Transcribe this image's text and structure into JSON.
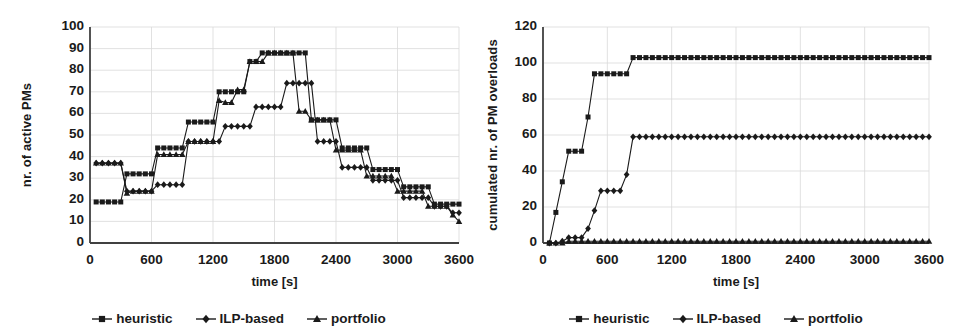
{
  "figure": {
    "background": "#ffffff",
    "ink": "#1a1a1a",
    "gridline_color": "#d9d9d9",
    "axis_color": "#404040"
  },
  "charts": [
    {
      "id": "left",
      "chart_data": {
        "type": "line",
        "title": "",
        "subtitle": "",
        "xlabel": "time [s]",
        "ylabel": "nr. of active PMs",
        "xlim": [
          0,
          3600
        ],
        "ylim": [
          0,
          100
        ],
        "xticks": [
          0,
          600,
          1200,
          1800,
          2400,
          3000,
          3600
        ],
        "yticks": [
          0,
          10,
          20,
          30,
          40,
          50,
          60,
          70,
          80,
          90,
          100
        ],
        "grid": true,
        "legend_position": "bottom",
        "series": [
          {
            "name": "heuristic",
            "marker": "square",
            "x": [
              60,
              120,
              180,
              240,
              300,
              360,
              420,
              480,
              540,
              600,
              660,
              720,
              780,
              840,
              900,
              960,
              1020,
              1080,
              1140,
              1200,
              1260,
              1320,
              1380,
              1440,
              1500,
              1560,
              1620,
              1680,
              1740,
              1800,
              1860,
              1920,
              1980,
              2040,
              2100,
              2160,
              2220,
              2280,
              2340,
              2400,
              2460,
              2520,
              2580,
              2640,
              2700,
              2760,
              2820,
              2880,
              2940,
              3000,
              3060,
              3120,
              3180,
              3240,
              3300,
              3360,
              3420,
              3480,
              3540,
              3600
            ],
            "y": [
              19,
              19,
              19,
              19,
              19,
              32,
              32,
              32,
              32,
              32,
              44,
              44,
              44,
              44,
              44,
              56,
              56,
              56,
              56,
              56,
              70,
              70,
              70,
              70,
              70,
              84,
              84,
              88,
              88,
              88,
              88,
              88,
              88,
              88,
              88,
              57,
              57,
              57,
              57,
              57,
              44,
              44,
              44,
              44,
              44,
              34,
              34,
              34,
              34,
              34,
              26,
              26,
              26,
              26,
              26,
              18,
              18,
              18,
              18,
              18
            ]
          },
          {
            "name": "ILP-based",
            "marker": "diamond",
            "x": [
              60,
              120,
              180,
              240,
              300,
              360,
              420,
              480,
              540,
              600,
              660,
              720,
              780,
              840,
              900,
              960,
              1020,
              1080,
              1140,
              1200,
              1260,
              1320,
              1380,
              1440,
              1500,
              1560,
              1620,
              1680,
              1740,
              1800,
              1860,
              1920,
              1980,
              2040,
              2100,
              2160,
              2220,
              2280,
              2340,
              2400,
              2460,
              2520,
              2580,
              2640,
              2700,
              2760,
              2820,
              2880,
              2940,
              3000,
              3060,
              3120,
              3180,
              3240,
              3300,
              3360,
              3420,
              3480,
              3540,
              3600
            ],
            "y": [
              37,
              37,
              37,
              37,
              37,
              24,
              24,
              24,
              24,
              24,
              27,
              27,
              27,
              27,
              27,
              47,
              47,
              47,
              47,
              47,
              47,
              54,
              54,
              54,
              54,
              54,
              63,
              63,
              63,
              63,
              63,
              74,
              74,
              74,
              74,
              74,
              47,
              47,
              47,
              47,
              35,
              35,
              35,
              35,
              35,
              29,
              29,
              29,
              29,
              29,
              21,
              21,
              21,
              21,
              21,
              17,
              17,
              17,
              14,
              14
            ]
          },
          {
            "name": "portfolio",
            "marker": "triangle",
            "x": [
              60,
              120,
              180,
              240,
              300,
              360,
              420,
              480,
              540,
              600,
              660,
              720,
              780,
              840,
              900,
              960,
              1020,
              1080,
              1140,
              1200,
              1260,
              1320,
              1380,
              1440,
              1500,
              1560,
              1620,
              1680,
              1740,
              1800,
              1860,
              1920,
              1980,
              2040,
              2100,
              2160,
              2220,
              2280,
              2340,
              2400,
              2460,
              2520,
              2580,
              2640,
              2700,
              2760,
              2820,
              2880,
              2940,
              3000,
              3060,
              3120,
              3180,
              3240,
              3300,
              3360,
              3420,
              3480,
              3540,
              3600
            ],
            "y": [
              37,
              37,
              37,
              37,
              37,
              23,
              24,
              24,
              24,
              24,
              41,
              41,
              41,
              41,
              41,
              47,
              47,
              47,
              47,
              47,
              66,
              65,
              65,
              71,
              71,
              84,
              84,
              84,
              88,
              88,
              88,
              88,
              88,
              61,
              61,
              57,
              57,
              57,
              57,
              43,
              43,
              43,
              43,
              43,
              31,
              31,
              31,
              31,
              31,
              24,
              24,
              24,
              24,
              24,
              17,
              17,
              17,
              17,
              13,
              10
            ]
          }
        ]
      }
    },
    {
      "id": "right",
      "chart_data": {
        "type": "line",
        "title": "",
        "subtitle": "",
        "xlabel": "time [s]",
        "ylabel": "cumulated nr. of PM overloads",
        "xlim": [
          0,
          3600
        ],
        "ylim": [
          0,
          120
        ],
        "xticks": [
          0,
          600,
          1200,
          1800,
          2400,
          3000,
          3600
        ],
        "yticks": [
          0,
          20,
          40,
          60,
          80,
          100,
          120
        ],
        "grid": true,
        "legend_position": "bottom",
        "series": [
          {
            "name": "heuristic",
            "marker": "square",
            "x": [
              60,
              120,
              180,
              240,
              300,
              360,
              420,
              480,
              540,
              600,
              660,
              720,
              780,
              840,
              900,
              960,
              1020,
              1080,
              1140,
              1200,
              1260,
              1320,
              1380,
              1440,
              1500,
              1560,
              1620,
              1680,
              1740,
              1800,
              1860,
              1920,
              1980,
              2040,
              2100,
              2160,
              2220,
              2280,
              2340,
              2400,
              2460,
              2520,
              2580,
              2640,
              2700,
              2760,
              2820,
              2880,
              2940,
              3000,
              3060,
              3120,
              3180,
              3240,
              3300,
              3360,
              3420,
              3480,
              3540,
              3600
            ],
            "y": [
              0,
              17,
              34,
              51,
              51,
              51,
              70,
              94,
              94,
              94,
              94,
              94,
              94,
              103,
              103,
              103,
              103,
              103,
              103,
              103,
              103,
              103,
              103,
              103,
              103,
              103,
              103,
              103,
              103,
              103,
              103,
              103,
              103,
              103,
              103,
              103,
              103,
              103,
              103,
              103,
              103,
              103,
              103,
              103,
              103,
              103,
              103,
              103,
              103,
              103,
              103,
              103,
              103,
              103,
              103,
              103,
              103,
              103,
              103,
              103
            ]
          },
          {
            "name": "ILP-based",
            "marker": "diamond",
            "x": [
              60,
              120,
              180,
              240,
              300,
              360,
              420,
              480,
              540,
              600,
              660,
              720,
              780,
              840,
              900,
              960,
              1020,
              1080,
              1140,
              1200,
              1260,
              1320,
              1380,
              1440,
              1500,
              1560,
              1620,
              1680,
              1740,
              1800,
              1860,
              1920,
              1980,
              2040,
              2100,
              2160,
              2220,
              2280,
              2340,
              2400,
              2460,
              2520,
              2580,
              2640,
              2700,
              2760,
              2820,
              2880,
              2940,
              3000,
              3060,
              3120,
              3180,
              3240,
              3300,
              3360,
              3420,
              3480,
              3540,
              3600
            ],
            "y": [
              0,
              0,
              1,
              3,
              3,
              3,
              8,
              18,
              29,
              29,
              29,
              29,
              38,
              59,
              59,
              59,
              59,
              59,
              59,
              59,
              59,
              59,
              59,
              59,
              59,
              59,
              59,
              59,
              59,
              59,
              59,
              59,
              59,
              59,
              59,
              59,
              59,
              59,
              59,
              59,
              59,
              59,
              59,
              59,
              59,
              59,
              59,
              59,
              59,
              59,
              59,
              59,
              59,
              59,
              59,
              59,
              59,
              59,
              59,
              59
            ]
          },
          {
            "name": "portfolio",
            "marker": "triangle",
            "x": [
              60,
              120,
              180,
              240,
              300,
              360,
              420,
              480,
              540,
              600,
              660,
              720,
              780,
              840,
              900,
              960,
              1020,
              1080,
              1140,
              1200,
              1260,
              1320,
              1380,
              1440,
              1500,
              1560,
              1620,
              1680,
              1740,
              1800,
              1860,
              1920,
              1980,
              2040,
              2100,
              2160,
              2220,
              2280,
              2340,
              2400,
              2460,
              2520,
              2580,
              2640,
              2700,
              2760,
              2820,
              2880,
              2940,
              3000,
              3060,
              3120,
              3180,
              3240,
              3300,
              3360,
              3420,
              3480,
              3540,
              3600
            ],
            "y": [
              0,
              0,
              0,
              1,
              1,
              1,
              1,
              1,
              1,
              1,
              1,
              1,
              1,
              1,
              1,
              1,
              1,
              1,
              1,
              1,
              1,
              1,
              1,
              1,
              1,
              1,
              1,
              1,
              1,
              1,
              1,
              1,
              1,
              1,
              1,
              1,
              1,
              1,
              1,
              1,
              1,
              1,
              1,
              1,
              1,
              1,
              1,
              1,
              1,
              1,
              1,
              1,
              1,
              1,
              1,
              1,
              1,
              1,
              1,
              1
            ]
          }
        ]
      }
    }
  ]
}
